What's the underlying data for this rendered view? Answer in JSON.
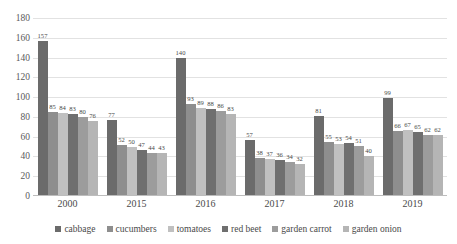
{
  "chart_data": {
    "type": "bar",
    "title": "",
    "xlabel": "",
    "ylabel": "",
    "ylim": [
      0,
      180
    ],
    "ytick_step": 20,
    "yticks": [
      0,
      20,
      40,
      60,
      80,
      100,
      120,
      140,
      160,
      180
    ],
    "grid": true,
    "legend_position": "bottom",
    "categories": [
      "2000",
      "2015",
      "2016",
      "2017",
      "2018",
      "2019"
    ],
    "series": [
      {
        "name": "cabbage",
        "color": "#6b6b6b",
        "values": [
          157,
          77,
          140,
          57,
          81,
          99
        ]
      },
      {
        "name": "cucumbers",
        "color": "#8e8e8e",
        "values": [
          85,
          52,
          93,
          38,
          55,
          66
        ]
      },
      {
        "name": "tomatoes",
        "color": "#c0c0c0",
        "values": [
          84,
          50,
          89,
          37,
          53,
          67
        ]
      },
      {
        "name": "red beet",
        "color": "#6f6f6f",
        "values": [
          83,
          47,
          88,
          36,
          54,
          65
        ]
      },
      {
        "name": "garden carrot",
        "color": "#9c9c9c",
        "values": [
          80,
          44,
          86,
          34,
          51,
          62
        ]
      },
      {
        "name": "garden onion",
        "color": "#b5b5b5",
        "values": [
          76,
          43,
          83,
          32,
          40,
          62
        ]
      }
    ]
  },
  "colors": {
    "grid": "#e2e2e2",
    "axis": "#bdbdbd",
    "text": "#4a4a4a",
    "background": "#ffffff"
  }
}
